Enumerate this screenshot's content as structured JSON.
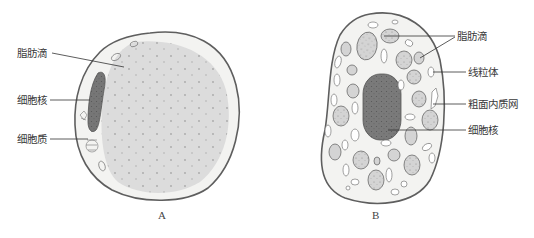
{
  "figure": {
    "panel_a": {
      "caption": "A",
      "labels": {
        "fat_droplet": "脂肪滴",
        "nucleus": "细胞核",
        "cytoplasm": "细胞质"
      }
    },
    "panel_b": {
      "caption": "B",
      "labels": {
        "fat_droplet": "脂肪滴",
        "mitochondria": "线粒体",
        "rough_er": "粗面内质网",
        "nucleus": "细胞核"
      }
    },
    "colors": {
      "membrane": "#5e5e5e",
      "cytoplasm": "#f2f2f0",
      "fat_droplet": "#dcdcdc",
      "nucleus": "#7a7a7a",
      "dots": "#a0a0a0",
      "leader_line": "#333333"
    }
  }
}
